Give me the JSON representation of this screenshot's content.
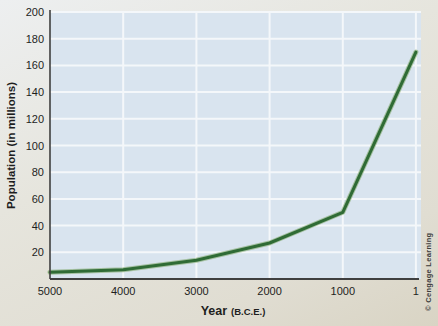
{
  "colors": {
    "page_bg_top": "#edeff0",
    "page_bg_bottom": "#d9d4c4",
    "plot_bg": "#d9e4ef",
    "gridline": "#f4f7fa",
    "axis": "#3f3f3f",
    "line_core": "#2f6b35",
    "line_halo": "#7aa463",
    "tick_text": "#1e1e1e",
    "credit_text": "#3c3c3c"
  },
  "chart_data": {
    "type": "line",
    "title": "",
    "series_name": "World population",
    "x": [
      5000,
      4000,
      3000,
      2000,
      1000,
      1
    ],
    "values": [
      5,
      7,
      14,
      27,
      50,
      170
    ],
    "xticks": [
      "5000",
      "4000",
      "3000",
      "2000",
      "1000",
      "1"
    ],
    "yticks": [
      20,
      40,
      60,
      80,
      100,
      120,
      140,
      160,
      180,
      200
    ],
    "xlim": [
      5000,
      1
    ],
    "ylim": [
      0,
      200
    ],
    "xlabel_main": "Year",
    "xlabel_sub": "(B.C.E.)",
    "ylabel": "Population (in millions)",
    "grid": true,
    "legend_position": "none"
  },
  "credit": "© Cengage Learning"
}
